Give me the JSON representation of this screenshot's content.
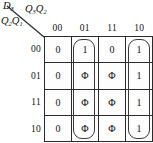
{
  "figure": {
    "kind": "karnaugh-map",
    "output_label": "D",
    "output_subscript": "3",
    "column_vars_label": "Q",
    "column_vars": [
      {
        "letter": "Q",
        "subscript": "3"
      },
      {
        "letter": "Q",
        "subscript": "2"
      }
    ],
    "row_vars": [
      {
        "letter": "Q",
        "subscript": "2"
      },
      {
        "letter": "Q",
        "subscript": "1"
      }
    ],
    "column_headers": [
      "00",
      "01",
      "11",
      "10"
    ],
    "row_headers": [
      "00",
      "01",
      "11",
      "10"
    ],
    "cells": [
      [
        "0",
        "1",
        "0",
        "1"
      ],
      [
        "0",
        "Φ",
        "Φ",
        "1"
      ],
      [
        "0",
        "Φ",
        "Φ",
        "1"
      ],
      [
        "0",
        "Φ",
        "Φ",
        "1"
      ]
    ],
    "groups": [
      {
        "name": "column-01-group",
        "column": "01",
        "rows": [
          "00",
          "01",
          "11",
          "10"
        ]
      },
      {
        "name": "column-10-group",
        "column": "10",
        "rows": [
          "00",
          "01",
          "11",
          "10"
        ]
      }
    ],
    "colors": {
      "grid_line": "#2b2b2b",
      "loop_line": "#3a3a3a",
      "text": "#111111",
      "background": "#ffffff"
    }
  }
}
